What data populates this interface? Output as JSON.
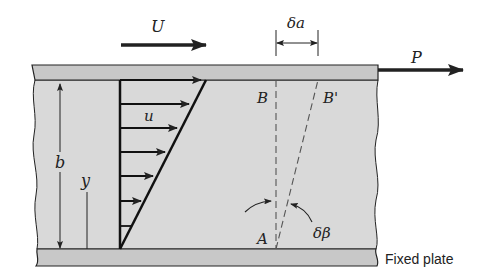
{
  "figure": {
    "type": "couette-flow-shear-deformation",
    "labels": {
      "upper_plate_velocity": "U",
      "applied_force": "P",
      "displacement": "δa",
      "local_velocity": "u",
      "gap_height": "b",
      "height_coordinate": "y",
      "point_b": "B",
      "point_b_prime": "B'",
      "point_a": "A",
      "shear_angle": "δβ",
      "bottom_plate": "Fixed plate"
    },
    "velocity_profile": {
      "shape": "linear",
      "arrow_count": 7
    },
    "colors": {
      "fluid_fill": "#d9d9d9",
      "plate_fill": "#c8c8c8",
      "stroke": "#222222",
      "background": "#ffffff"
    }
  }
}
